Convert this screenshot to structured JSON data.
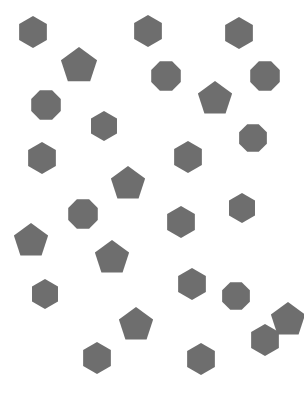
{
  "scene": {
    "title": "scattered-polygons",
    "width": 304,
    "height": 409,
    "background_color": "#ffffff",
    "shape_fill_color": "#6e6e6e",
    "total_shapes": 26,
    "counts": {
      "hexagon": 13,
      "pentagon": 7,
      "octagon": 6
    },
    "shapes": [
      {
        "id": 1,
        "type": "hexagon",
        "cx": 33,
        "cy": 32,
        "r": 16,
        "rotation": 0
      },
      {
        "id": 2,
        "type": "hexagon",
        "cx": 148,
        "cy": 31,
        "r": 16,
        "rotation": 0
      },
      {
        "id": 3,
        "type": "hexagon",
        "cx": 239,
        "cy": 33,
        "r": 16,
        "rotation": 0
      },
      {
        "id": 4,
        "type": "pentagon",
        "cx": 79,
        "cy": 66,
        "r": 19,
        "rotation": 0
      },
      {
        "id": 5,
        "type": "octagon",
        "cx": 166,
        "cy": 76,
        "r": 16,
        "rotation": 22.5
      },
      {
        "id": 6,
        "type": "octagon",
        "cx": 265,
        "cy": 76,
        "r": 16,
        "rotation": 22.5
      },
      {
        "id": 7,
        "type": "octagon",
        "cx": 46,
        "cy": 105,
        "r": 16,
        "rotation": 22.5
      },
      {
        "id": 8,
        "type": "pentagon",
        "cx": 215,
        "cy": 99,
        "r": 18,
        "rotation": 0
      },
      {
        "id": 9,
        "type": "hexagon",
        "cx": 104,
        "cy": 126,
        "r": 15,
        "rotation": 0
      },
      {
        "id": 10,
        "type": "octagon",
        "cx": 253,
        "cy": 138,
        "r": 15,
        "rotation": 22.5
      },
      {
        "id": 11,
        "type": "hexagon",
        "cx": 42,
        "cy": 158,
        "r": 16,
        "rotation": 0
      },
      {
        "id": 12,
        "type": "hexagon",
        "cx": 188,
        "cy": 157,
        "r": 16,
        "rotation": 0
      },
      {
        "id": 13,
        "type": "pentagon",
        "cx": 128,
        "cy": 184,
        "r": 18,
        "rotation": 0
      },
      {
        "id": 14,
        "type": "octagon",
        "cx": 83,
        "cy": 214,
        "r": 16,
        "rotation": 22.5
      },
      {
        "id": 15,
        "type": "hexagon",
        "cx": 181,
        "cy": 222,
        "r": 16,
        "rotation": 0
      },
      {
        "id": 16,
        "type": "hexagon",
        "cx": 242,
        "cy": 208,
        "r": 15,
        "rotation": 0
      },
      {
        "id": 17,
        "type": "pentagon",
        "cx": 31,
        "cy": 241,
        "r": 18,
        "rotation": 0
      },
      {
        "id": 18,
        "type": "pentagon",
        "cx": 112,
        "cy": 258,
        "r": 18,
        "rotation": 0
      },
      {
        "id": 19,
        "type": "hexagon",
        "cx": 192,
        "cy": 284,
        "r": 16,
        "rotation": 0
      },
      {
        "id": 20,
        "type": "octagon",
        "cx": 236,
        "cy": 296,
        "r": 15,
        "rotation": 22.5
      },
      {
        "id": 21,
        "type": "hexagon",
        "cx": 45,
        "cy": 294,
        "r": 15,
        "rotation": 0
      },
      {
        "id": 22,
        "type": "pentagon",
        "cx": 136,
        "cy": 325,
        "r": 18,
        "rotation": 0
      },
      {
        "id": 23,
        "type": "pentagon",
        "cx": 288,
        "cy": 320,
        "r": 18,
        "rotation": 0
      },
      {
        "id": 24,
        "type": "hexagon",
        "cx": 265,
        "cy": 340,
        "r": 16,
        "rotation": 0
      },
      {
        "id": 25,
        "type": "hexagon",
        "cx": 97,
        "cy": 358,
        "r": 16,
        "rotation": 0
      },
      {
        "id": 26,
        "type": "hexagon",
        "cx": 201,
        "cy": 359,
        "r": 16,
        "rotation": 0
      }
    ]
  }
}
